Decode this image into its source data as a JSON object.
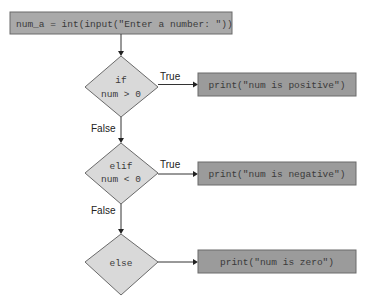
{
  "flowchart": {
    "start_box": {
      "label": "num_a = int(input(\"Enter a number: \"))"
    },
    "decisions": [
      {
        "line1": "if",
        "line2": "num > 0",
        "true_label": "True",
        "false_label": "False"
      },
      {
        "line1": "elif",
        "line2": "num < 0",
        "true_label": "True",
        "false_label": "False"
      },
      {
        "line1": "else",
        "line2": ""
      }
    ],
    "actions": [
      {
        "label": "print(\"num is positive\")"
      },
      {
        "label": "print(\"num is negative\")"
      },
      {
        "label": "print(\"num is zero\")"
      }
    ]
  },
  "colors": {
    "start_box_fill": "#a9a9a9",
    "action_box_fill": "#9b9b9b",
    "diamond_fill": "#d9d9d9",
    "stroke": "#6a6a6a"
  }
}
